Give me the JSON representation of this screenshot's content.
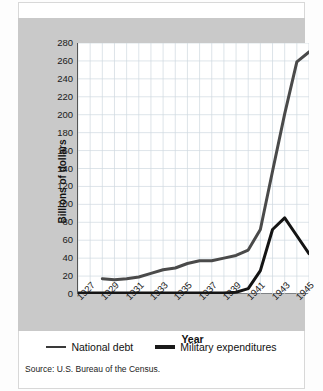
{
  "chart_data": {
    "type": "line",
    "title": "",
    "xlabel": "Year",
    "ylabel": "Billions of dollars",
    "xlim": [
      1927,
      1946
    ],
    "ylim": [
      0,
      280
    ],
    "ytick_step": 20,
    "grid": true,
    "legend_position": "bottom",
    "yticks": [
      280,
      260,
      240,
      220,
      200,
      180,
      160,
      140,
      120,
      100,
      80,
      60,
      40,
      20,
      0
    ],
    "xticks": [
      1927,
      1929,
      1931,
      1933,
      1935,
      1937,
      1939,
      1941,
      1943,
      1945
    ],
    "x": [
      1929,
      1930,
      1931,
      1932,
      1933,
      1934,
      1935,
      1936,
      1937,
      1938,
      1939,
      1940,
      1941,
      1942,
      1943,
      1944,
      1945,
      1946
    ],
    "series": [
      {
        "name": "National debt",
        "color": "#4a4a4a",
        "width": 3,
        "x": [
          1929,
          1930,
          1931,
          1932,
          1933,
          1934,
          1935,
          1936,
          1937,
          1938,
          1939,
          1940,
          1941,
          1942,
          1943,
          1944,
          1945,
          1946
        ],
        "values": [
          17,
          16,
          17,
          19,
          23,
          27,
          29,
          34,
          37,
          37,
          40,
          43,
          49,
          72,
          137,
          201,
          259,
          270
        ]
      },
      {
        "name": "Military expenditures",
        "color": "#141414",
        "width": 3,
        "x": [
          1927,
          1929,
          1931,
          1933,
          1935,
          1937,
          1939,
          1940,
          1941,
          1942,
          1943,
          1944,
          1945,
          1946
        ],
        "values": [
          1,
          1,
          1,
          1,
          1,
          1,
          1,
          2,
          6,
          26,
          72,
          85,
          65,
          45
        ]
      }
    ],
    "source": "Source: U.S. Bureau of the Census."
  },
  "legend": {
    "items": [
      {
        "label": "National debt"
      },
      {
        "label": "Military expenditures"
      }
    ]
  },
  "axis": {
    "x_title": "Year",
    "y_title": "Billions of dollars"
  },
  "footer": {
    "source": "Source: U.S. Bureau of the Census."
  }
}
